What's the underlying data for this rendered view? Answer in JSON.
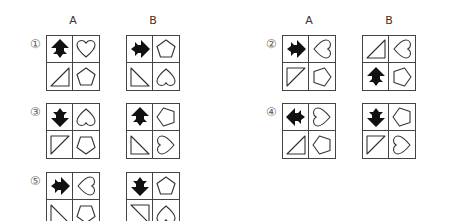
{
  "column_labels": [
    "A",
    "B"
  ],
  "problems": [
    {
      "number": "①",
      "A": [
        "arrow-up",
        "heart",
        "triangle-br",
        "pentagon"
      ],
      "B": [
        "arrow-right",
        "pentagon",
        "triangle-bl",
        "heart-down"
      ]
    },
    {
      "number": "②",
      "A": [
        "arrow-right",
        "heart-left",
        "triangle-tl",
        "pentagon-right"
      ],
      "B": [
        "triangle-br",
        "heart-left",
        "arrow-up",
        "pentagon-right"
      ]
    },
    {
      "number": "③",
      "A": [
        "arrow-down",
        "heart-down",
        "triangle-tl",
        "pentagon-down"
      ],
      "B": [
        "arrow-up",
        "pentagon-left",
        "triangle-bl",
        "heart-right"
      ]
    },
    {
      "number": "④",
      "A": [
        "arrow-left",
        "heart-right",
        "triangle-br",
        "pentagon-left"
      ],
      "B": [
        "arrow-down",
        "pentagon-left",
        "triangle-tl",
        "heart-right"
      ]
    },
    {
      "number": "⑤",
      "A": [
        "arrow-right",
        "heart-left",
        "triangle-bl",
        "pentagon-down"
      ],
      "B": [
        "arrow-down",
        "pentagon",
        "triangle-tr",
        "heart-down"
      ]
    }
  ]
}
